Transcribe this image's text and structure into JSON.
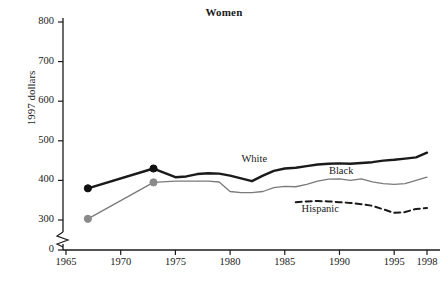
{
  "chart_data": {
    "type": "line",
    "title": "Women",
    "xlabel": "",
    "ylabel": "1997 dollars",
    "xlim": [
      1964,
      1999
    ],
    "ylim": [
      0,
      800
    ],
    "yticks": [
      0,
      300,
      400,
      500,
      600,
      700,
      800
    ],
    "ytick_labels": [
      "0",
      "300",
      "400",
      "500",
      "600",
      "700",
      "800"
    ],
    "y_axis_break": true,
    "y_break_note": "axis broken between 0 and 300",
    "xticks": [
      1965,
      1970,
      1975,
      1980,
      1985,
      1990,
      1995,
      1998
    ],
    "xtick_labels": [
      "1965",
      "1970",
      "1975",
      "1980",
      "1985",
      "1990",
      "1995",
      "1998"
    ],
    "grid": false,
    "legend_position": "inline-annotations",
    "series": [
      {
        "name": "White",
        "color": "#1a1a1a",
        "style": "solid",
        "width": 2.4,
        "markers": [
          1967,
          1973
        ],
        "marker_color": "#111111",
        "label_x": 1982.5,
        "label_y": 455,
        "x": [
          1967,
          1973,
          1975,
          1976,
          1977,
          1978,
          1979,
          1980,
          1981,
          1982,
          1983,
          1984,
          1985,
          1986,
          1987,
          1988,
          1989,
          1990,
          1991,
          1992,
          1993,
          1994,
          1995,
          1996,
          1997,
          1998
        ],
        "values": [
          380,
          430,
          408,
          410,
          416,
          418,
          417,
          412,
          405,
          398,
          412,
          424,
          430,
          432,
          436,
          440,
          442,
          443,
          442,
          444,
          446,
          450,
          452,
          455,
          458,
          470
        ]
      },
      {
        "name": "Black",
        "color": "#7a7a7a",
        "style": "solid",
        "width": 1.3,
        "markers": [
          1967,
          1973
        ],
        "marker_color": "#8a8a8a",
        "label_x": 1990.5,
        "label_y": 424,
        "x": [
          1967,
          1973,
          1975,
          1976,
          1977,
          1978,
          1979,
          1980,
          1981,
          1982,
          1983,
          1984,
          1985,
          1986,
          1987,
          1988,
          1989,
          1990,
          1991,
          1992,
          1993,
          1994,
          1995,
          1996,
          1997,
          1998
        ],
        "values": [
          303,
          395,
          398,
          398,
          398,
          398,
          396,
          372,
          369,
          369,
          372,
          382,
          385,
          384,
          390,
          398,
          403,
          404,
          400,
          404,
          396,
          392,
          390,
          392,
          400,
          408
        ]
      },
      {
        "name": "Hispanic",
        "color": "#1a1a1a",
        "style": "dashed",
        "width": 2.0,
        "markers": [],
        "marker_color": "#1a1a1a",
        "label_x": 1988.0,
        "label_y": 327,
        "x": [
          1986,
          1987,
          1988,
          1989,
          1990,
          1991,
          1992,
          1993,
          1994,
          1995,
          1996,
          1997,
          1998
        ],
        "values": [
          345,
          347,
          348,
          347,
          345,
          343,
          340,
          336,
          327,
          318,
          320,
          328,
          330
        ]
      }
    ]
  }
}
